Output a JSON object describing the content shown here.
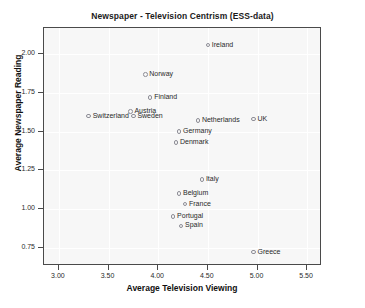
{
  "chart_data": {
    "type": "scatter",
    "title": "Newspaper - Television Centrism (ESS-data)",
    "xlabel": "Average Television Viewing",
    "ylabel": "Average Newspaper Reading",
    "xlim": [
      2.85,
      5.65
    ],
    "ylim": [
      0.63,
      2.17
    ],
    "xticks": [
      "3.00",
      "3.50",
      "4.00",
      "4.50",
      "5.00",
      "5.50"
    ],
    "xtick_values": [
      3.0,
      3.5,
      4.0,
      4.5,
      5.0,
      5.5
    ],
    "yticks": [
      "2.00",
      "1.75",
      "1.50",
      "1.25",
      "1.00",
      "0.75"
    ],
    "ytick_values": [
      2.0,
      1.75,
      1.5,
      1.25,
      1.0,
      0.75
    ],
    "grid": true,
    "legend": "none",
    "marker": "open-circle",
    "points": [
      {
        "label": "Ireland",
        "x": 4.5,
        "y": 2.06,
        "label_side": "right"
      },
      {
        "label": "Norway",
        "x": 3.87,
        "y": 1.87,
        "label_side": "right"
      },
      {
        "label": "Finland",
        "x": 3.92,
        "y": 1.72,
        "label_side": "right"
      },
      {
        "label": "Austria",
        "x": 3.72,
        "y": 1.63,
        "label_side": "right"
      },
      {
        "label": "Sweden",
        "x": 3.75,
        "y": 1.6,
        "label_side": "right"
      },
      {
        "label": "Switzerland",
        "x": 3.3,
        "y": 1.6,
        "label_side": "right"
      },
      {
        "label": "Netherlands",
        "x": 4.4,
        "y": 1.57,
        "label_side": "right"
      },
      {
        "label": "UK",
        "x": 4.96,
        "y": 1.58,
        "label_side": "right"
      },
      {
        "label": "Germany",
        "x": 4.21,
        "y": 1.5,
        "label_side": "right"
      },
      {
        "label": "Denmark",
        "x": 4.18,
        "y": 1.43,
        "label_side": "right"
      },
      {
        "label": "Italy",
        "x": 4.44,
        "y": 1.19,
        "label_side": "right"
      },
      {
        "label": "Belgium",
        "x": 4.21,
        "y": 1.1,
        "label_side": "right"
      },
      {
        "label": "France",
        "x": 4.27,
        "y": 1.03,
        "label_side": "right"
      },
      {
        "label": "Portugal",
        "x": 4.15,
        "y": 0.95,
        "label_side": "right"
      },
      {
        "label": "Spain",
        "x": 4.23,
        "y": 0.89,
        "label_side": "right"
      },
      {
        "label": "Greece",
        "x": 4.96,
        "y": 0.72,
        "label_side": "right"
      }
    ]
  }
}
